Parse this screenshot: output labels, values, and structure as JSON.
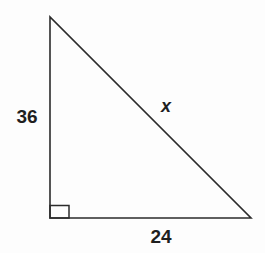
{
  "figure": {
    "type": "right-triangle-diagram",
    "labels": {
      "vertical_leg": "36",
      "horizontal_leg": "24",
      "hypotenuse": "x"
    },
    "colors": {
      "stroke": "#2b2b2b",
      "background": "#fdfdfd",
      "text": "#1f1f1f"
    }
  }
}
